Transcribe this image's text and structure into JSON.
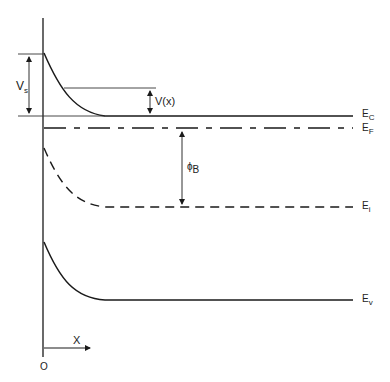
{
  "diagram": {
    "type": "band-diagram",
    "colors": {
      "line": "#1a1a1a",
      "thin": "#333333",
      "background": "#ffffff"
    },
    "labels": {
      "Vs_main": "V",
      "Vs_sub": "s",
      "Vx": "V(x)",
      "phiB_main": "ϕ",
      "phiB_sub": "B",
      "Ec_main": "E",
      "Ec_sub": "C",
      "Ef_main": "E",
      "Ef_sub": "F",
      "Ei_main": "E",
      "Ei_sub": "i",
      "Ev_main": "E",
      "Ev_sub": "v",
      "x_axis": "X",
      "origin": "O"
    },
    "bands": [
      {
        "name": "E_C",
        "style": "solid",
        "surface_y": 53,
        "bulk_y": 116
      },
      {
        "name": "E_F",
        "style": "long-dash",
        "y": 128
      },
      {
        "name": "E_i",
        "style": "dashed",
        "surface_y": 148,
        "bulk_y": 207
      },
      {
        "name": "E_v",
        "style": "solid",
        "surface_y": 242,
        "bulk_y": 300
      }
    ],
    "annotations": [
      {
        "name": "Vs",
        "description": "surface potential, double arrow from E_C surface to bulk E_C"
      },
      {
        "name": "V(x)",
        "description": "potential at position x, double arrow"
      },
      {
        "name": "phi_B",
        "description": "bulk potential between E_F and E_i"
      }
    ]
  }
}
